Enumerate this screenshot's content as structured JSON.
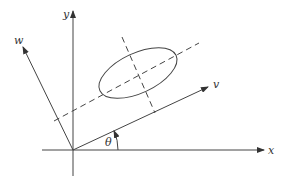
{
  "diagram": {
    "axes": {
      "x_label": "x",
      "y_label": "y",
      "v_label": "v",
      "w_label": "w"
    },
    "angle_label": "θ",
    "colors": {
      "line": "#444444",
      "background": "#ffffff"
    }
  }
}
